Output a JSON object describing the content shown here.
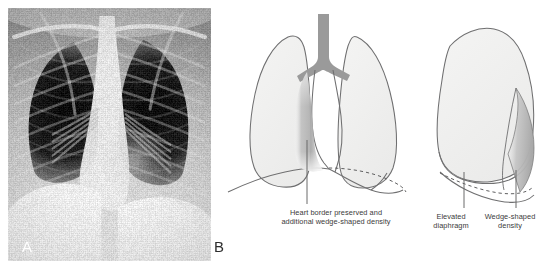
{
  "figure": {
    "panel_a": {
      "label": "A",
      "kind": "chest-radiograph-frontal"
    },
    "panel_b": {
      "label": "B",
      "kind": "line-diagram",
      "frontal": {
        "caption_line1": "Heart border preserved and",
        "caption_line2": "additional wedge-shaped density"
      },
      "lateral": {
        "caption_elevated_line1": "Elevated",
        "caption_elevated_line2": "diaphragm",
        "caption_wedge_line1": "Wedge-shaped",
        "caption_wedge_line2": "density"
      }
    }
  },
  "colors": {
    "lung_fill": "#f1f1f0",
    "lung_outline": "#6f6f70",
    "airway_fill": "#9a9a9a",
    "density_shade": "#b8b8b8",
    "leader_line": "#6a6a6a",
    "caption_text": "#3a3a3a",
    "panel_label_a": "#ffffff",
    "panel_label_b": "#2d2d2d",
    "background": "#ffffff"
  }
}
